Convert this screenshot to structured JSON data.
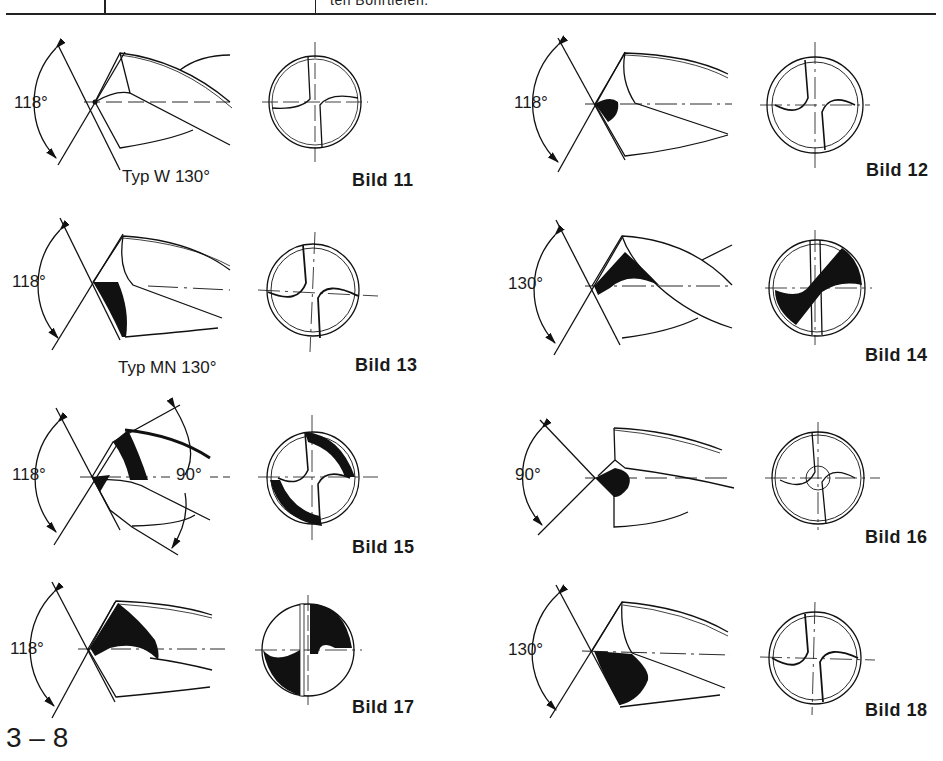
{
  "header": {
    "cut_off_text": "ten Bohrtiefen."
  },
  "figures": [
    {
      "id": "bild-11",
      "label": "Bild 11",
      "angle": "118°",
      "type_note": "Typ W 130°"
    },
    {
      "id": "bild-12",
      "label": "Bild 12",
      "angle": "118°",
      "type_note": ""
    },
    {
      "id": "bild-13",
      "label": "Bild 13",
      "angle": "118°",
      "type_note": "Typ MN 130°"
    },
    {
      "id": "bild-14",
      "label": "Bild 14",
      "angle": "130°",
      "type_note": ""
    },
    {
      "id": "bild-15",
      "label": "Bild 15",
      "angle": "118°",
      "secondary_angle": "90°",
      "type_note": ""
    },
    {
      "id": "bild-16",
      "label": "Bild 16",
      "angle": "90°",
      "type_note": ""
    },
    {
      "id": "bild-17",
      "label": "Bild 17",
      "angle": "118°",
      "type_note": ""
    },
    {
      "id": "bild-18",
      "label": "Bild 18",
      "angle": "130°",
      "type_note": ""
    }
  ],
  "footer": {
    "page_number": "3 – 8"
  }
}
